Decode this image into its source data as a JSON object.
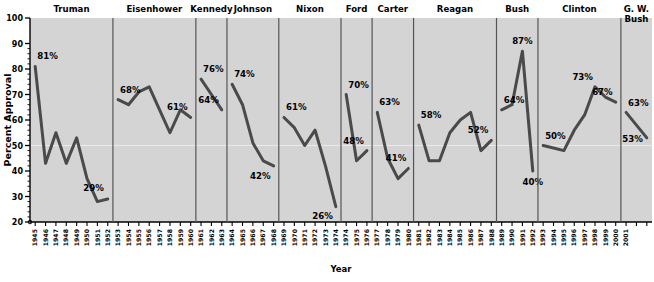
{
  "chart_data": {
    "type": "line",
    "title": "",
    "xlabel": "Year",
    "ylabel": "Percent Approval",
    "ylim": [
      20,
      100
    ],
    "ytick_labels": [
      "100",
      "90",
      "80",
      "70",
      "60",
      "50",
      "40",
      "30",
      "20"
    ],
    "ytick_values": [
      100,
      90,
      80,
      70,
      60,
      50,
      40,
      30,
      20
    ],
    "grid": false,
    "legend": "none",
    "panel_label_position": "top",
    "series": [
      {
        "name": "Truman",
        "x": [
          "1945",
          "1946",
          "1947",
          "1948",
          "1949",
          "1950",
          "1951",
          "1952"
        ],
        "values": [
          81,
          43,
          55,
          43,
          53,
          37,
          28,
          29
        ],
        "annotations": [
          {
            "x": "1945",
            "label": "81%"
          },
          {
            "x": "1952",
            "label": "29%"
          }
        ]
      },
      {
        "name": "Eisenhower",
        "x": [
          "1953",
          "1954",
          "1955",
          "1956",
          "1957",
          "1958",
          "1959",
          "1960"
        ],
        "values": [
          68,
          66,
          71,
          73,
          64,
          55,
          64,
          61
        ],
        "annotations": [
          {
            "x": "1953",
            "label": "68%"
          },
          {
            "x": "1960",
            "label": "61%"
          }
        ]
      },
      {
        "name": "Kennedy",
        "x": [
          "1961",
          "1962",
          "1963"
        ],
        "values": [
          76,
          70,
          64
        ],
        "annotations": [
          {
            "x": "1961",
            "label": "76%"
          },
          {
            "x": "1963",
            "label": "64%"
          }
        ]
      },
      {
        "name": "Johnson",
        "x": [
          "1964",
          "1965",
          "1966",
          "1967",
          "1968"
        ],
        "values": [
          74,
          66,
          51,
          44,
          42
        ],
        "annotations": [
          {
            "x": "1964",
            "label": "74%"
          },
          {
            "x": "1968",
            "label": "42%"
          }
        ]
      },
      {
        "name": "Nixon",
        "x": [
          "1969",
          "1970",
          "1971",
          "1972",
          "1973",
          "1974"
        ],
        "values": [
          61,
          57,
          50,
          56,
          42,
          26
        ],
        "annotations": [
          {
            "x": "1969",
            "label": "61%"
          },
          {
            "x": "1974",
            "label": "26%"
          }
        ]
      },
      {
        "name": "Ford",
        "x": [
          "1974",
          "1975",
          "1976"
        ],
        "values": [
          70,
          44,
          48
        ],
        "annotations": [
          {
            "x": "1974",
            "label": "70%"
          },
          {
            "x": "1976",
            "label": "48%"
          }
        ]
      },
      {
        "name": "Carter",
        "x": [
          "1977",
          "1978",
          "1979",
          "1980"
        ],
        "values": [
          63,
          45,
          37,
          41
        ],
        "annotations": [
          {
            "x": "1977",
            "label": "63%"
          },
          {
            "x": "1980",
            "label": "41%"
          }
        ]
      },
      {
        "name": "Reagan",
        "x": [
          "1981",
          "1982",
          "1983",
          "1984",
          "1985",
          "1986",
          "1987",
          "1988"
        ],
        "values": [
          58,
          44,
          44,
          55,
          60,
          63,
          48,
          52
        ],
        "annotations": [
          {
            "x": "1981",
            "label": "58%"
          },
          {
            "x": "1988",
            "label": "52%"
          }
        ]
      },
      {
        "name": "Bush",
        "x": [
          "1989",
          "1990",
          "1991",
          "1992"
        ],
        "values": [
          64,
          66,
          87,
          40
        ],
        "annotations": [
          {
            "x": "1989",
            "label": "64%"
          },
          {
            "x": "1991",
            "label": "87%"
          },
          {
            "x": "1992",
            "label": "40%"
          }
        ]
      },
      {
        "name": "Clinton",
        "x": [
          "1993",
          "1994",
          "1995",
          "1996",
          "1997",
          "1998",
          "1999",
          "2000"
        ],
        "values": [
          50,
          49,
          48,
          56,
          62,
          73,
          69,
          67
        ],
        "annotations": [
          {
            "x": "1993",
            "label": "50%"
          },
          {
            "x": "1998",
            "label": "73%"
          },
          {
            "x": "2000",
            "label": "67%"
          }
        ]
      },
      {
        "name": "G. W. Bush",
        "x": [
          "2001",
          "2002",
          "2003"
        ],
        "values": [
          63,
          58,
          53
        ],
        "annotations": [
          {
            "x": "2001",
            "label": "63%"
          },
          {
            "x": "2003",
            "label": "53%"
          }
        ]
      }
    ],
    "xtick_labels": [
      "1945",
      "1946",
      "1947",
      "1948",
      "1949",
      "1950",
      "1951",
      "1952",
      "1953",
      "1954",
      "1955",
      "1956",
      "1957",
      "1958",
      "1959",
      "1960",
      "1961",
      "1962",
      "1963",
      "1964",
      "1965",
      "1966",
      "1967",
      "1968",
      "1969",
      "1970",
      "1971",
      "1972",
      "1973",
      "1974",
      "1975",
      "1976",
      "1977",
      "1978",
      "1979",
      "1980",
      "1981",
      "1982",
      "1983",
      "1984",
      "1985",
      "1986",
      "1987",
      "1988",
      "1989",
      "1990",
      "1991",
      "1992",
      "1993",
      "1994",
      "1995",
      "1996",
      "1997",
      "1998",
      "1999",
      "2000",
      "2001",
      "",
      ""
    ]
  },
  "colors": {
    "plot_background": "#d4d4d4",
    "line": "#4a4a4a",
    "axis": "#000000",
    "divider": "#555555",
    "page_background": "#ffffff"
  },
  "panel_labels": [
    "Truman",
    "Eisenhower",
    "Kennedy",
    "Johnson",
    "Nixon",
    "Ford",
    "Carter",
    "Reagan",
    "Bush",
    "Clinton",
    "G. W. Bush"
  ]
}
